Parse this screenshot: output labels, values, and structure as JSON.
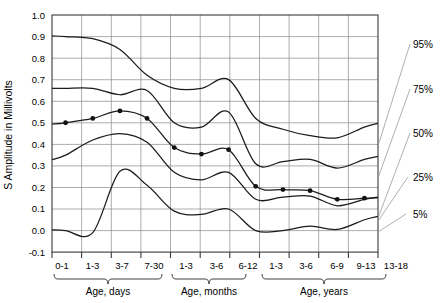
{
  "chart_data": {
    "type": "line",
    "title": "",
    "subtitle": "",
    "xlabel": "",
    "ylabel": "S Amplitude in Millivolts",
    "ylim": [
      -0.1,
      1.0
    ],
    "ytick_labels": [
      "1.0",
      "0.9",
      "0.8",
      "0.7",
      "0.6",
      "0.5",
      "0.4",
      "0.3",
      "0.2",
      "0.1",
      "0.0",
      "-0.1"
    ],
    "ytick_values": [
      1.0,
      0.9,
      0.8,
      0.7,
      0.6,
      0.5,
      0.4,
      0.3,
      0.2,
      0.1,
      0.0,
      -0.1
    ],
    "grid": true,
    "legend_position": "right-outside",
    "categories": [
      "0-1",
      "1-3",
      "3-7",
      "7-30",
      "1-3",
      "3-6",
      "6-12",
      "1-3",
      "3-6",
      "6-9",
      "9-13",
      "13-18"
    ],
    "x_group_labels": [
      "Age, days",
      "Age, months",
      "Age, years"
    ],
    "x_groups": [
      {
        "label": "Age, days",
        "categories": [
          "0-1",
          "1-3",
          "3-7",
          "7-30"
        ]
      },
      {
        "label": "Age, months",
        "categories": [
          "1-3",
          "3-6",
          "6-12"
        ]
      },
      {
        "label": "Age, years",
        "categories": [
          "1-3",
          "3-6",
          "6-9",
          "9-13",
          "13-18"
        ]
      }
    ],
    "series": [
      {
        "name": "95%",
        "label": "95%",
        "values": [
          0.9,
          0.89,
          0.84,
          0.72,
          0.66,
          0.66,
          0.7,
          0.52,
          0.47,
          0.44,
          0.43,
          0.48
        ]
      },
      {
        "name": "75%",
        "label": "75%",
        "values": [
          0.66,
          0.66,
          0.63,
          0.65,
          0.5,
          0.48,
          0.55,
          0.31,
          0.32,
          0.33,
          0.29,
          0.33
        ]
      },
      {
        "name": "50%",
        "label": "50%",
        "values": [
          0.5,
          0.52,
          0.555,
          0.52,
          0.385,
          0.355,
          0.375,
          0.205,
          0.19,
          0.185,
          0.145,
          0.15
        ]
      },
      {
        "name": "25%",
        "label": "25%",
        "values": [
          0.35,
          0.42,
          0.45,
          0.41,
          0.27,
          0.235,
          0.27,
          0.145,
          0.155,
          0.16,
          0.115,
          0.145
        ]
      },
      {
        "name": "5%",
        "label": "5%",
        "values": [
          0.0,
          -0.01,
          0.275,
          0.21,
          0.09,
          0.075,
          0.1,
          0.0,
          0.0,
          0.02,
          0.005,
          0.05
        ]
      }
    ],
    "marker_series": "50%",
    "marker_points": [
      {
        "x": "0-1",
        "y": 0.5
      },
      {
        "x": "1-3",
        "y": 0.52
      },
      {
        "x": "3-7",
        "y": 0.555
      },
      {
        "x": "7-30",
        "y": 0.52
      },
      {
        "x": "1-3",
        "y": 0.385
      },
      {
        "x": "3-6",
        "y": 0.355
      },
      {
        "x": "6-12",
        "y": 0.375
      },
      {
        "x": "1-3",
        "y": 0.205
      },
      {
        "x": "3-6",
        "y": 0.19
      },
      {
        "x": "6-9",
        "y": 0.185
      },
      {
        "x": "9-13",
        "y": 0.145
      },
      {
        "x": "13-18",
        "y": 0.15
      }
    ],
    "percentile_labels": [
      "95%",
      "75%",
      "50%",
      "25%",
      "5%"
    ],
    "colors": {
      "curve": "#1b1b1b",
      "grid": "#8a8a8a",
      "frame": "#3a3a3a",
      "leader": "#9b9b9b",
      "marker": "#111111"
    }
  }
}
